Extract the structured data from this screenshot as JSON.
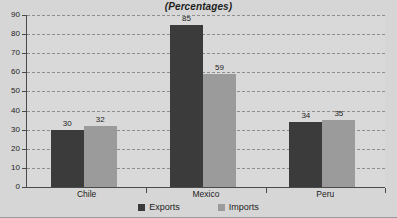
{
  "chart_data": {
    "type": "bar",
    "title": "(Percentages)",
    "xlabel": "",
    "ylabel": "",
    "categories": [
      "Chile",
      "Mexico",
      "Peru"
    ],
    "series": [
      {
        "name": "Exports",
        "values": [
          30,
          85,
          34
        ],
        "color": "#3b3b3b"
      },
      {
        "name": "Imports",
        "values": [
          32,
          59,
          35
        ],
        "color": "#9b9b9b"
      }
    ],
    "ylim": [
      0,
      90
    ],
    "yticks": [
      0,
      10,
      20,
      30,
      40,
      50,
      60,
      70,
      80,
      90
    ],
    "ytick_labels": [
      "0",
      "10",
      "20",
      "30",
      "40",
      "50",
      "60",
      "70",
      "80",
      "90"
    ],
    "grid": "horizontal-dashed",
    "legend_position": "bottom",
    "data_labels": [
      {
        "category": "Chile",
        "series": "Exports",
        "value": "30"
      },
      {
        "category": "Chile",
        "series": "Imports",
        "value": "32"
      },
      {
        "category": "Mexico",
        "series": "Exports",
        "value": "85"
      },
      {
        "category": "Mexico",
        "series": "Imports",
        "value": "59"
      },
      {
        "category": "Peru",
        "series": "Exports",
        "value": "34"
      },
      {
        "category": "Peru",
        "series": "Imports",
        "value": "35"
      }
    ]
  },
  "legend": {
    "items": [
      {
        "label": "Exports",
        "swatch_color": "#3b3b3b"
      },
      {
        "label": "Imports",
        "swatch_color": "#9b9b9b"
      }
    ]
  },
  "colors": {
    "background": "#d6d6d6",
    "plot_background": "#d9d9d9",
    "axis": "#4a4a4a",
    "grid": "#8e8e8e",
    "text": "#1d1d1d"
  }
}
